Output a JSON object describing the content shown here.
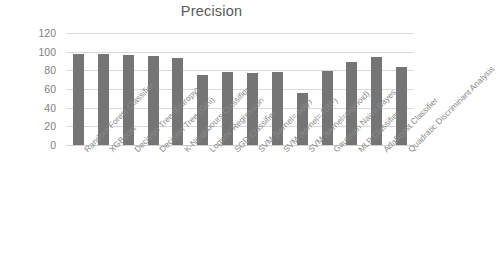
{
  "chart_data": {
    "type": "bar",
    "title": "Precision",
    "xlabel": "",
    "ylabel": "",
    "ylim": [
      0,
      120
    ],
    "ytick_step": 20,
    "yticks": [
      "120",
      "100",
      "80",
      "60",
      "40",
      "20",
      "0"
    ],
    "grid": true,
    "legend": false,
    "bar_color": "#757575",
    "gridline_color": "#d9d9d9",
    "label_rotation_deg": -45,
    "categories": [
      "Random Forest Classifier",
      "XGBoost",
      "Decision Tree (Entropy)",
      "Decision Tree (Gini)",
      "K-Neighbours Classifier",
      "Logistic Regression",
      "SGD Classifier",
      "SVM (kernel= poly)",
      "SVM (kernel= RBF)",
      "SVM (kernel=sigmoid)",
      "Gaussian Naive Bayes",
      "MLP Classifier",
      "AdaBoost Classifier",
      "Quadratic Discriminant Analysis"
    ],
    "values": [
      98,
      98,
      96,
      95,
      93,
      75,
      78,
      77,
      78,
      56,
      79,
      89,
      94,
      84
    ]
  }
}
